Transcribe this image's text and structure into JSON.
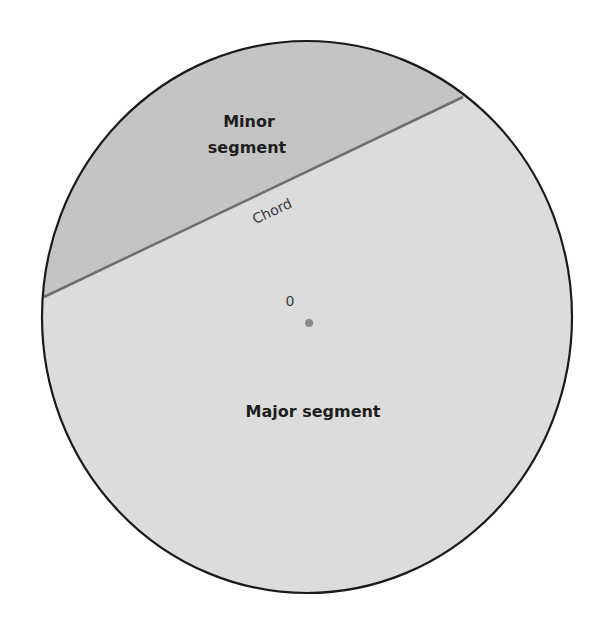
{
  "diagram": {
    "labels": {
      "minor_line1": "Minor",
      "minor_line2": "segment",
      "chord": "Chord",
      "center": "0",
      "major": "Major segment"
    },
    "colors": {
      "minor_fill": "#c4c4c4",
      "major_fill": "#dcdcdc",
      "outline": "#1a1a1a",
      "chord_line": "#6e6e6e",
      "center_dot": "#8a8a8a"
    }
  }
}
